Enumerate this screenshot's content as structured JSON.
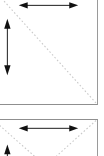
{
  "figure": {
    "type": "technical-diagram",
    "background_color": "#ffffff",
    "border_color": "#8f8f8f",
    "diagonal_color": "#c9c9c9",
    "arrow_color": "#111111",
    "panel_count": 2,
    "panels": [
      {
        "id": "panel-top",
        "name": "upper-diagram-panel",
        "diagonals": [
          {
            "name": "diagonal-top-left-to-bottom-right",
            "style": "dotted",
            "from": "top-left-corner",
            "to": "bottom-right-corner"
          }
        ],
        "arrows": [
          {
            "name": "horizontal-dimension-arrow",
            "orientation": "horizontal",
            "heads": "both",
            "label": ""
          },
          {
            "name": "vertical-dimension-arrow",
            "orientation": "vertical",
            "heads": "both",
            "label": ""
          }
        ]
      },
      {
        "id": "panel-bottom",
        "name": "lower-diagram-panel",
        "diagonals": [
          {
            "name": "diagonal-top-left-descending",
            "style": "dotted",
            "from": "top-left-corner",
            "to": "bottom-center"
          },
          {
            "name": "diagonal-top-right-descending",
            "style": "dotted",
            "from": "top-right-corner",
            "to": "bottom-center"
          }
        ],
        "arrows": [
          {
            "name": "horizontal-dimension-arrow",
            "orientation": "horizontal",
            "heads": "both",
            "label": ""
          },
          {
            "name": "vertical-dimension-arrow",
            "orientation": "vertical",
            "heads": "single-up",
            "label": ""
          }
        ]
      }
    ]
  }
}
